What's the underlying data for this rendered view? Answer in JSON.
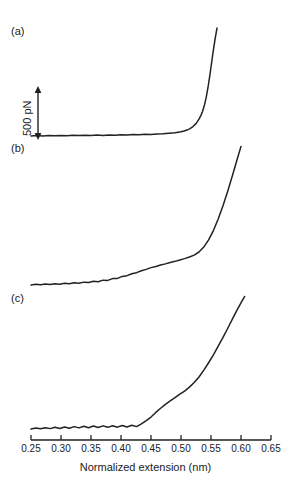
{
  "figure": {
    "panels": [
      {
        "id": "a",
        "label": "(a)"
      },
      {
        "id": "b",
        "label": "(b)"
      },
      {
        "id": "c",
        "label": "(c)"
      }
    ],
    "scalebar": {
      "label": "500 pN",
      "value": 500,
      "units": "pN"
    }
  },
  "chart_data": {
    "type": "line",
    "title": "",
    "xlabel": "Normalized extension (nm)",
    "ylabel": "Force",
    "xlim": [
      0.25,
      0.65
    ],
    "xticks": [
      0.25,
      0.3,
      0.35,
      0.4,
      0.45,
      0.5,
      0.55,
      0.6,
      0.65
    ],
    "xtick_labels": [
      "0.25",
      "0.30",
      "0.35",
      "0.40",
      "0.45",
      "0.50",
      "0.55",
      "0.60",
      "0.65"
    ],
    "grid": false,
    "legend": false,
    "yaxis_visible": false,
    "scale_bar": {
      "label": "500 pN",
      "value": 500,
      "units": "pN"
    },
    "annotations": [
      "(a)",
      "(b)",
      "(c)"
    ],
    "series": [
      {
        "name": "(a)",
        "label": "(a)",
        "color": "#222222",
        "x": [
          0.25,
          0.26,
          0.27,
          0.28,
          0.29,
          0.3,
          0.31,
          0.32,
          0.33,
          0.34,
          0.35,
          0.36,
          0.37,
          0.38,
          0.39,
          0.4,
          0.41,
          0.42,
          0.43,
          0.44,
          0.45,
          0.46,
          0.47,
          0.48,
          0.49,
          0.5,
          0.505,
          0.51,
          0.515,
          0.52,
          0.525,
          0.53,
          0.533,
          0.536,
          0.539,
          0.542,
          0.545,
          0.548,
          0.551,
          0.554,
          0.557,
          0.56
        ],
        "y": [
          0.0,
          0.004,
          0.001,
          0.005,
          0.002,
          0.006,
          0.003,
          0.007,
          0.004,
          0.008,
          0.005,
          0.009,
          0.006,
          0.01,
          0.008,
          0.012,
          0.01,
          0.014,
          0.013,
          0.017,
          0.016,
          0.021,
          0.022,
          0.028,
          0.032,
          0.042,
          0.05,
          0.06,
          0.075,
          0.095,
          0.125,
          0.17,
          0.205,
          0.25,
          0.31,
          0.39,
          0.49,
          0.61,
          0.74,
          0.87,
          0.985,
          1.09
        ]
      },
      {
        "name": "(b)",
        "label": "(b)",
        "color": "#222222",
        "x": [
          0.25,
          0.258,
          0.266,
          0.274,
          0.282,
          0.29,
          0.298,
          0.306,
          0.314,
          0.322,
          0.33,
          0.338,
          0.346,
          0.354,
          0.362,
          0.37,
          0.378,
          0.386,
          0.394,
          0.402,
          0.41,
          0.418,
          0.426,
          0.434,
          0.442,
          0.45,
          0.458,
          0.466,
          0.474,
          0.482,
          0.49,
          0.498,
          0.506,
          0.514,
          0.522,
          0.53,
          0.538,
          0.546,
          0.554,
          0.562,
          0.57,
          0.578,
          0.586,
          0.594,
          0.6
        ],
        "y": [
          0.0,
          0.006,
          0.002,
          0.009,
          0.004,
          0.012,
          0.007,
          0.015,
          0.011,
          0.02,
          0.016,
          0.026,
          0.022,
          0.034,
          0.03,
          0.044,
          0.042,
          0.058,
          0.06,
          0.078,
          0.085,
          0.102,
          0.112,
          0.13,
          0.142,
          0.158,
          0.168,
          0.182,
          0.192,
          0.205,
          0.215,
          0.228,
          0.24,
          0.255,
          0.272,
          0.3,
          0.345,
          0.41,
          0.495,
          0.6,
          0.72,
          0.855,
          1.0,
          1.15,
          1.26
        ]
      },
      {
        "name": "(c)",
        "label": "(c)",
        "color": "#222222",
        "x": [
          0.25,
          0.258,
          0.266,
          0.274,
          0.282,
          0.29,
          0.298,
          0.306,
          0.314,
          0.322,
          0.33,
          0.338,
          0.346,
          0.354,
          0.362,
          0.37,
          0.378,
          0.386,
          0.394,
          0.402,
          0.41,
          0.418,
          0.426,
          0.434,
          0.442,
          0.45,
          0.458,
          0.466,
          0.474,
          0.482,
          0.49,
          0.498,
          0.506,
          0.514,
          0.522,
          0.53,
          0.538,
          0.546,
          0.554,
          0.562,
          0.57,
          0.578,
          0.586,
          0.594,
          0.602,
          0.606
        ],
        "y": [
          0.0,
          0.01,
          0.002,
          0.014,
          0.004,
          0.018,
          0.006,
          0.022,
          0.008,
          0.026,
          0.012,
          0.03,
          0.014,
          0.032,
          0.016,
          0.034,
          0.018,
          0.036,
          0.02,
          0.038,
          0.022,
          0.04,
          0.026,
          0.055,
          0.09,
          0.13,
          0.18,
          0.225,
          0.268,
          0.305,
          0.34,
          0.378,
          0.412,
          0.455,
          0.505,
          0.565,
          0.64,
          0.72,
          0.805,
          0.9,
          0.995,
          1.095,
          1.2,
          1.3,
          1.395,
          1.44
        ]
      }
    ]
  }
}
